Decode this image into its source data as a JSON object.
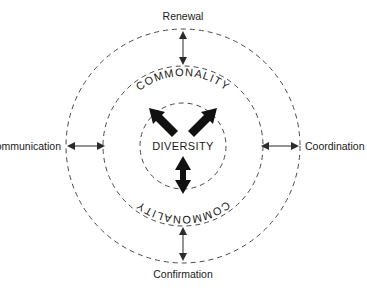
{
  "diagram": {
    "type": "concentric-circles",
    "center_label": "DIVERSITY",
    "ring_labels": {
      "inner_ring_top": "COMMONALITY",
      "inner_ring_bottom": "COMMONALITY"
    },
    "outer_labels": {
      "top": "Renewal",
      "left": "Communication",
      "right": "Coordination",
      "bottom": "Confirmation"
    },
    "colors": {
      "background": "#ffffff",
      "circle_stroke": "#4a4a4a",
      "text": "#1a1a1a",
      "arrow_fill": "#111111"
    },
    "geometry": {
      "center_x": 183,
      "center_y": 146,
      "inner_radius": 43,
      "middle_radius": 80,
      "outer_radius": 117
    }
  }
}
